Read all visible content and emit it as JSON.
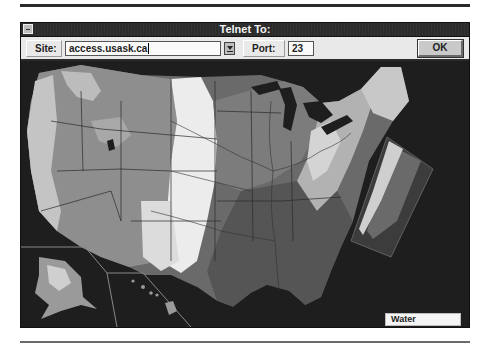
{
  "window": {
    "title": "Telnet To:",
    "system_menu_icon": "system-menu-icon"
  },
  "toolbar": {
    "site_label": "Site:",
    "site_value": "access.usask.ca",
    "dropdown_icon": "dropdown-arrow-icon",
    "port_label": "Port:",
    "port_value": "23",
    "ok_label": "OK"
  },
  "map": {
    "description": "Shaded relief map of the United States with state boundaries and rivers",
    "insets": [
      "Alaska",
      "Hawaii",
      "Northeast enlargement"
    ],
    "legend": {
      "label": "Water"
    },
    "colors": {
      "water": "#1e1e1e",
      "lowland": "#5a5a5a",
      "midland": "#8a8a8a",
      "plains": "#e6e6e6",
      "mountains": "#b8b8b8"
    }
  }
}
